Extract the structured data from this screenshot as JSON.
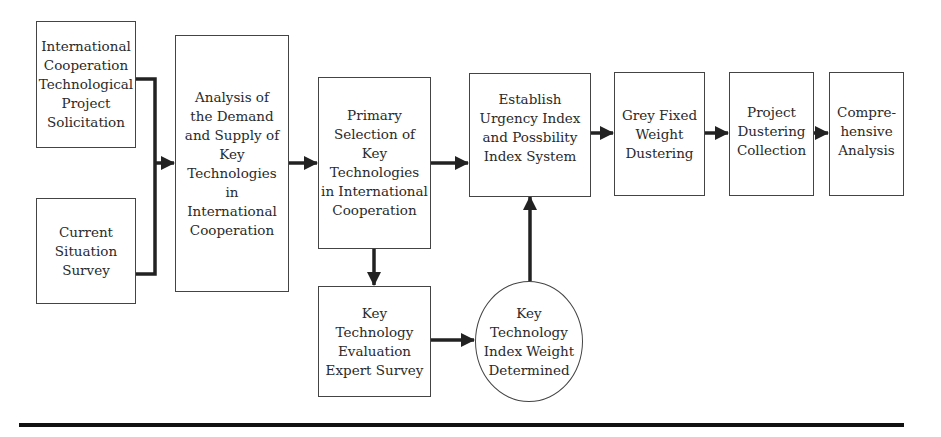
{
  "diagram": {
    "nodes": [
      {
        "id": "n1",
        "label": "International\nCooperation\nTechnological\nProject\nSolicitation",
        "shape": "rect"
      },
      {
        "id": "n2",
        "label": "Current\nSituation\nSurvey",
        "shape": "rect"
      },
      {
        "id": "n3",
        "label": "Analysis of\nthe Demand\nand Supply of\nKey\nTechnologies\nin\nInternational\nCooperation",
        "shape": "rect"
      },
      {
        "id": "n4",
        "label": "Primary\nSelection of\nKey\nTechnologies\nin International\nCooperation",
        "shape": "rect"
      },
      {
        "id": "n5",
        "label": "Establish\nUrgency Index\nand Possbility\nIndex System",
        "shape": "rect"
      },
      {
        "id": "n6",
        "label": "Grey Fixed\nWeight\nDustering",
        "shape": "rect"
      },
      {
        "id": "n7",
        "label": "Project\nDustering\nCollection",
        "shape": "rect"
      },
      {
        "id": "n8",
        "label": "Compre-\nhensive\nAnalysis",
        "shape": "rect"
      },
      {
        "id": "n9",
        "label": "Key\nTechnology\nEvaluation\nExpert Survey",
        "shape": "rect"
      },
      {
        "id": "n10",
        "label": "Key\nTechnology\nIndex Weight\nDetermined",
        "shape": "circle"
      }
    ],
    "edges": [
      {
        "from": "n1",
        "to": "n3"
      },
      {
        "from": "n2",
        "to": "n3"
      },
      {
        "from": "n3",
        "to": "n4"
      },
      {
        "from": "n4",
        "to": "n5"
      },
      {
        "from": "n4",
        "to": "n9"
      },
      {
        "from": "n9",
        "to": "n10"
      },
      {
        "from": "n10",
        "to": "n5"
      },
      {
        "from": "n5",
        "to": "n6"
      },
      {
        "from": "n6",
        "to": "n7"
      },
      {
        "from": "n7",
        "to": "n8"
      }
    ]
  }
}
